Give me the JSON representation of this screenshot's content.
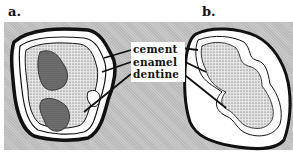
{
  "panels": [
    {
      "label": "a."
    },
    {
      "label": "b."
    }
  ],
  "legend": {
    "items": [
      {
        "label": "cement"
      },
      {
        "label": "enamel"
      },
      {
        "label": "dentine"
      }
    ]
  },
  "colors": {
    "background": "#c9c9c9",
    "outline": "#111111",
    "cement_fill": "#ffffff",
    "dentine_fill": "#b8b8b8",
    "pulp_fill": "#6e6e6e"
  }
}
